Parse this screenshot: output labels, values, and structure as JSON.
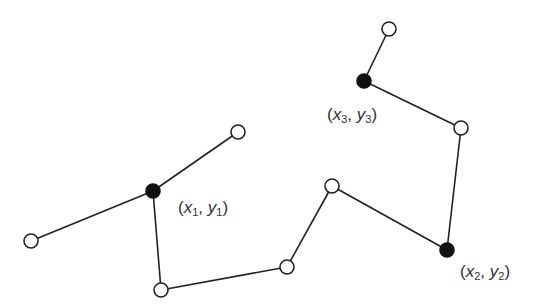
{
  "diagram": {
    "nodes": [
      {
        "id": "n1",
        "x": 31,
        "y": 241,
        "type": "open"
      },
      {
        "id": "n2",
        "x": 153,
        "y": 191,
        "type": "filled",
        "label": "x1y1"
      },
      {
        "id": "n3",
        "x": 238,
        "y": 132,
        "type": "open"
      },
      {
        "id": "n4",
        "x": 161,
        "y": 290,
        "type": "open"
      },
      {
        "id": "n5",
        "x": 287,
        "y": 267,
        "type": "open"
      },
      {
        "id": "n6",
        "x": 332,
        "y": 186,
        "type": "open"
      },
      {
        "id": "n7",
        "x": 447,
        "y": 250,
        "type": "filled",
        "label": "x2y2"
      },
      {
        "id": "n8",
        "x": 461,
        "y": 128,
        "type": "open"
      },
      {
        "id": "n9",
        "x": 364,
        "y": 81,
        "type": "filled",
        "label": "x3y3"
      },
      {
        "id": "n10",
        "x": 389,
        "y": 29,
        "type": "open"
      }
    ],
    "edges": [
      [
        "n1",
        "n2"
      ],
      [
        "n2",
        "n3"
      ],
      [
        "n2",
        "n4"
      ],
      [
        "n4",
        "n5"
      ],
      [
        "n5",
        "n6"
      ],
      [
        "n6",
        "n7"
      ],
      [
        "n7",
        "n8"
      ],
      [
        "n8",
        "n9"
      ],
      [
        "n9",
        "n10"
      ]
    ],
    "labels": {
      "p1": {
        "open": "(",
        "x": "x",
        "xsub": "1",
        "sep": ", ",
        "y": "y",
        "ysub": "1",
        "close": ")"
      },
      "p2": {
        "open": "(",
        "x": "x",
        "xsub": "2",
        "sep": ", ",
        "y": "y",
        "ysub": "2",
        "close": ")"
      },
      "p3": {
        "open": "(",
        "x": "x",
        "xsub": "3",
        "sep": ", ",
        "y": "y",
        "ysub": "3",
        "close": ")"
      }
    }
  }
}
